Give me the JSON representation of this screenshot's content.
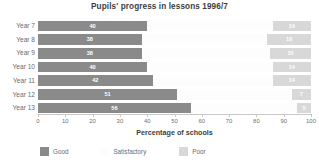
{
  "chart_data": {
    "type": "bar",
    "orientation": "horizontal",
    "stacked": true,
    "title": "Pupils' progress in lessons 1996/7",
    "xlabel": "Percentage of schools",
    "ylabel": "",
    "xlim": [
      0,
      100
    ],
    "xticks": [
      0,
      10,
      20,
      30,
      40,
      50,
      60,
      70,
      80,
      90,
      100
    ],
    "xtick_labels": [
      "0",
      "10",
      "20",
      "30",
      "40",
      "50",
      "60",
      "70",
      "80",
      "90",
      "100"
    ],
    "grid": false,
    "legend_position": "bottom-left",
    "categories": [
      "Year 7",
      "Year 8",
      "Year 9",
      "Year 10",
      "Year 11",
      "Year 12",
      "Year 13"
    ],
    "series": [
      {
        "name": "Good",
        "color": "#8a8a8a",
        "values": [
          40,
          38,
          38,
          40,
          42,
          51,
          56
        ],
        "labels": [
          "40",
          "38",
          "38",
          "40",
          "42",
          "51",
          "56"
        ],
        "show_labels": true
      },
      {
        "name": "Satisfactory",
        "color": "#fdfdfd",
        "values": [
          46,
          46,
          47,
          46,
          44,
          42,
          39
        ],
        "labels": [
          "",
          "",
          "",
          "",
          "",
          "",
          ""
        ],
        "show_labels": false
      },
      {
        "name": "Poor",
        "color": "#d8d8d8",
        "values": [
          14,
          16,
          15,
          14,
          14,
          7,
          5
        ],
        "labels": [
          "14",
          "16",
          "15",
          "14",
          "14",
          "7",
          "5"
        ],
        "show_labels": true
      }
    ]
  },
  "legend": {
    "items": [
      {
        "label": "Good",
        "color": "#8a8a8a",
        "offset_px": 0
      },
      {
        "label": "Satisfactory",
        "color": "#fdfdfd",
        "offset_px": 70
      },
      {
        "label": "Poor",
        "color": "#d8d8d8",
        "offset_px": 141
      }
    ]
  },
  "colors": {
    "good": "#8a8a8a",
    "satisfactory": "#fdfdfd",
    "poor": "#d8d8d8",
    "axis": "#c8c8c8",
    "title_text": "#3d3d3d",
    "label_text": "#6b6b6b",
    "background": "#ffffff"
  }
}
